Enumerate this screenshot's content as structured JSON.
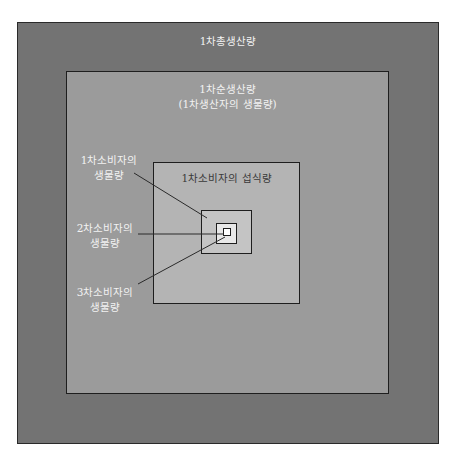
{
  "diagram": {
    "type": "nested-boxes",
    "outer": {
      "label": "1차총생산량",
      "color": "#737373"
    },
    "net_production": {
      "label_line1": "1차순생산량",
      "label_line2": "(1차생산자의 생물량)",
      "color": "#9b9b9b"
    },
    "consumer_intake": {
      "label": "1차소비자의 섭식량",
      "color": "#b4b4b4"
    },
    "primary_consumer_biomass": {
      "color": "#c4c4c4"
    },
    "secondary_consumer_biomass": {
      "color": "#e8e8e8"
    },
    "tertiary_consumer_biomass": {
      "color": "#ffffff"
    },
    "callouts": [
      {
        "line1": "1차소비자의",
        "line2": "생물량"
      },
      {
        "line1": "2차소비자의",
        "line2": "생물량"
      },
      {
        "line1": "3차소비자의",
        "line2": "생물량"
      }
    ],
    "border_color": "#1e1e1e"
  }
}
